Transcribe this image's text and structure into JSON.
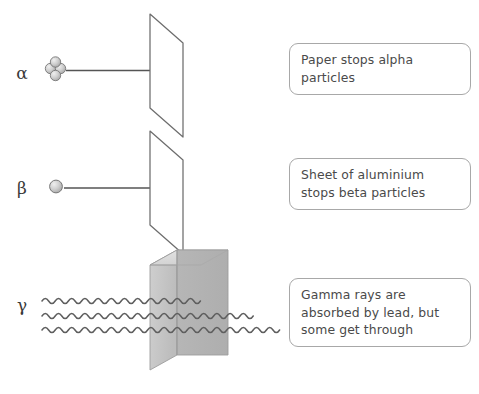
{
  "diagram": {
    "background_color": "#ffffff",
    "line_color": "#555555",
    "text_color": "#4a4a4a",
    "callout_border_color": "#a8a8a8"
  },
  "rows": [
    {
      "id": "alpha",
      "symbol": "α",
      "symbol_name": "alpha",
      "particle_icon": "alpha-particle-cluster-icon",
      "particle_description": "cluster of four small spheres (two protons, two neutrons)",
      "barrier": "paper-sheet",
      "barrier_label": "Paper",
      "ray_type": "straight-line",
      "ray_stopped": true,
      "callout": "Paper stops alpha\nparticles"
    },
    {
      "id": "beta",
      "symbol": "β",
      "symbol_name": "beta",
      "particle_icon": "beta-particle-circle-icon",
      "particle_description": "single small sphere (electron)",
      "barrier": "aluminium-sheet",
      "barrier_label": "Sheet of aluminium",
      "ray_type": "straight-line",
      "ray_stopped": true,
      "callout": "Sheet of aluminium\nstops beta particles"
    },
    {
      "id": "gamma",
      "symbol": "γ",
      "symbol_name": "gamma",
      "particle_icon": "gamma-wave-icon",
      "particle_description": "three wavy lines representing electromagnetic waves",
      "barrier": "lead-block",
      "barrier_label": "Lead",
      "ray_type": "wavy-line",
      "ray_stopped": false,
      "wave_count": 3,
      "waves_absorbed": 2,
      "waves_through": 1,
      "callout": "Gamma rays are\nabsorbed by lead, but\nsome get through"
    }
  ],
  "barriers": {
    "paper": {
      "name": "paper-sheet",
      "shape": "parallelogram",
      "fill": "#ffffff",
      "stroke": "#6d6d6d"
    },
    "aluminium": {
      "name": "aluminium-sheet",
      "shape": "parallelogram",
      "fill": "#ffffff",
      "stroke": "#6d6d6d"
    },
    "lead": {
      "name": "lead-block",
      "shape": "isometric-cuboid",
      "top_face_fill": "#dcdcdc",
      "left_face_fill": "#c4c4c4",
      "front_face_fill": "#b2b2b2",
      "stroke": "#9a9a9a"
    }
  },
  "particles": {
    "alpha_sphere_fill": "#c9c9c9",
    "alpha_sphere_stroke": "#6f6f6f",
    "beta_sphere_fill": "#c9c9c9",
    "beta_sphere_stroke": "#6f6f6f"
  }
}
